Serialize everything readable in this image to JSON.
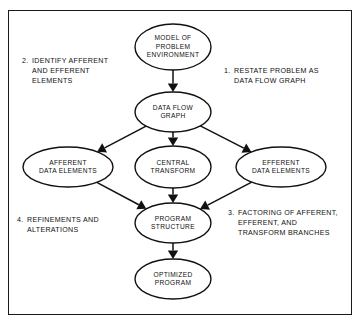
{
  "figure": {
    "type": "flowchart",
    "background_color": "#ffffff",
    "border_color": "#1a1a1a",
    "node_fill": "#ffffff",
    "node_stroke": "#111111",
    "text_color": "#101010"
  },
  "nodes": [
    {
      "id": "model-of-problem-environment",
      "lines": [
        "MODEL OF",
        "PROBLEM",
        "ENVIRONMENT"
      ],
      "cx": 173,
      "cy": 47,
      "rx": 38,
      "ry": 23
    },
    {
      "id": "data-flow-graph",
      "lines": [
        "DATA FLOW",
        "GRAPH"
      ],
      "cx": 173,
      "cy": 112,
      "rx": 38,
      "ry": 20
    },
    {
      "id": "afferent-data-elements",
      "lines": [
        "AFFERENT",
        "DATA ELEMENTS"
      ],
      "cx": 68,
      "cy": 167,
      "rx": 45,
      "ry": 20
    },
    {
      "id": "central-transform",
      "lines": [
        "CENTRAL",
        "TRANSFORM"
      ],
      "cx": 173,
      "cy": 167,
      "rx": 38,
      "ry": 21
    },
    {
      "id": "efferent-data-elements",
      "lines": [
        "EFFERENT",
        "DATA ELEMENTS"
      ],
      "cx": 281,
      "cy": 167,
      "rx": 45,
      "ry": 20
    },
    {
      "id": "program-structure",
      "lines": [
        "PROGRAM",
        "STRUCTURE"
      ],
      "cx": 173,
      "cy": 223,
      "rx": 38,
      "ry": 20
    },
    {
      "id": "optimized-program",
      "lines": [
        "OPTIMIZED",
        "PROGRAM"
      ],
      "cx": 173,
      "cy": 279,
      "rx": 38,
      "ry": 20
    }
  ],
  "edges": [
    {
      "id": "model-to-dataflow",
      "from": "model-of-problem-environment",
      "to": "data-flow-graph",
      "kind": "vertical"
    },
    {
      "id": "dataflow-to-afferent",
      "from": "data-flow-graph",
      "to": "afferent-data-elements",
      "kind": "diagonal-left"
    },
    {
      "id": "dataflow-to-central",
      "from": "data-flow-graph",
      "to": "central-transform",
      "kind": "vertical"
    },
    {
      "id": "dataflow-to-efferent",
      "from": "data-flow-graph",
      "to": "efferent-data-elements",
      "kind": "diagonal-right"
    },
    {
      "id": "afferent-to-program",
      "from": "afferent-data-elements",
      "to": "program-structure",
      "kind": "diagonal-right"
    },
    {
      "id": "central-to-program",
      "from": "central-transform",
      "to": "program-structure",
      "kind": "vertical"
    },
    {
      "id": "efferent-to-program",
      "from": "efferent-data-elements",
      "to": "program-structure",
      "kind": "diagonal-left"
    },
    {
      "id": "program-to-optimized",
      "from": "program-structure",
      "to": "optimized-program",
      "kind": "vertical"
    }
  ],
  "annotations": [
    {
      "id": "step-1",
      "number": "1.",
      "lines": [
        "RESTATE PROBLEM AS",
        "DATA FLOW GRAPH"
      ],
      "num_x": 224,
      "text_x": 234,
      "y": 73
    },
    {
      "id": "step-2",
      "number": "2.",
      "lines": [
        "IDENTIFY AFFERENT",
        "AND EFFERENT",
        "ELEMENTS"
      ],
      "num_x": 22,
      "text_x": 32,
      "y": 63
    },
    {
      "id": "step-3",
      "number": "3.",
      "lines": [
        "FACTORING OF AFFERENT,",
        "EFFERENT, AND",
        "TRANSFORM BRANCHES"
      ],
      "num_x": 228,
      "text_x": 238,
      "y": 215
    },
    {
      "id": "step-4",
      "number": "4.",
      "lines": [
        "REFINEMENTS AND",
        "ALTERATIONS"
      ],
      "num_x": 17,
      "text_x": 27,
      "y": 222
    }
  ]
}
